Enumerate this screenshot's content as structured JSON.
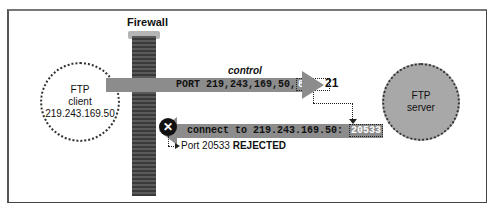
{
  "title": "Firewall",
  "client": {
    "line1": "FTP",
    "line2": "client",
    "ip": "219.243.169.50"
  },
  "server": {
    "line1": "FTP",
    "line2": "server"
  },
  "control_label": "control",
  "port_number": "21",
  "command1": {
    "prefix": "PORT 219,243,169,50,",
    "highlight": "80,53"
  },
  "command2": {
    "prefix": "connect to 219.243.169.50: ",
    "highlight": "20533"
  },
  "rejected": {
    "prefix": "Port 20533 ",
    "status": "REJECTED"
  },
  "icons": {
    "blocked": "✕"
  }
}
